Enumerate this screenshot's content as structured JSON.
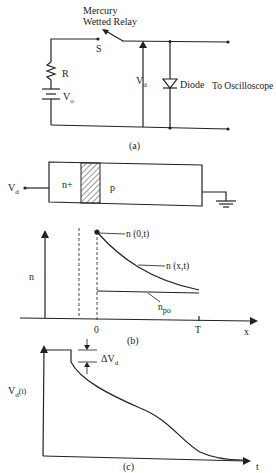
{
  "figure_a": {
    "relay_label_line1": "Mercury",
    "relay_label_line2": "Wetted Relay",
    "switch_label": "S",
    "resistor_label": "R",
    "source_label": "V",
    "source_sub": "o",
    "voltage_label": "V",
    "voltage_sub": "d",
    "diode_label": "Diode",
    "scope_label": "To Oscilloscope",
    "caption": "(a)"
  },
  "figure_b": {
    "terminal_label": "V",
    "terminal_sub": "d",
    "region_n_label": "n+",
    "region_p_label": "p",
    "y_axis_label": "n",
    "point_label": "n (0,t)",
    "curve_label": "n (x,t)",
    "equilibrium_label": "n",
    "equilibrium_sub": "po",
    "x_tick_0": "0",
    "x_tick_T": "T",
    "x_axis_label": "x",
    "caption": "(b)"
  },
  "figure_c": {
    "y_axis_label": "V",
    "y_axis_sub": "d",
    "y_axis_suffix": "(t)",
    "step_label": "ΔV",
    "step_sub": "d",
    "x_axis_label": "t",
    "caption": "(c)"
  }
}
